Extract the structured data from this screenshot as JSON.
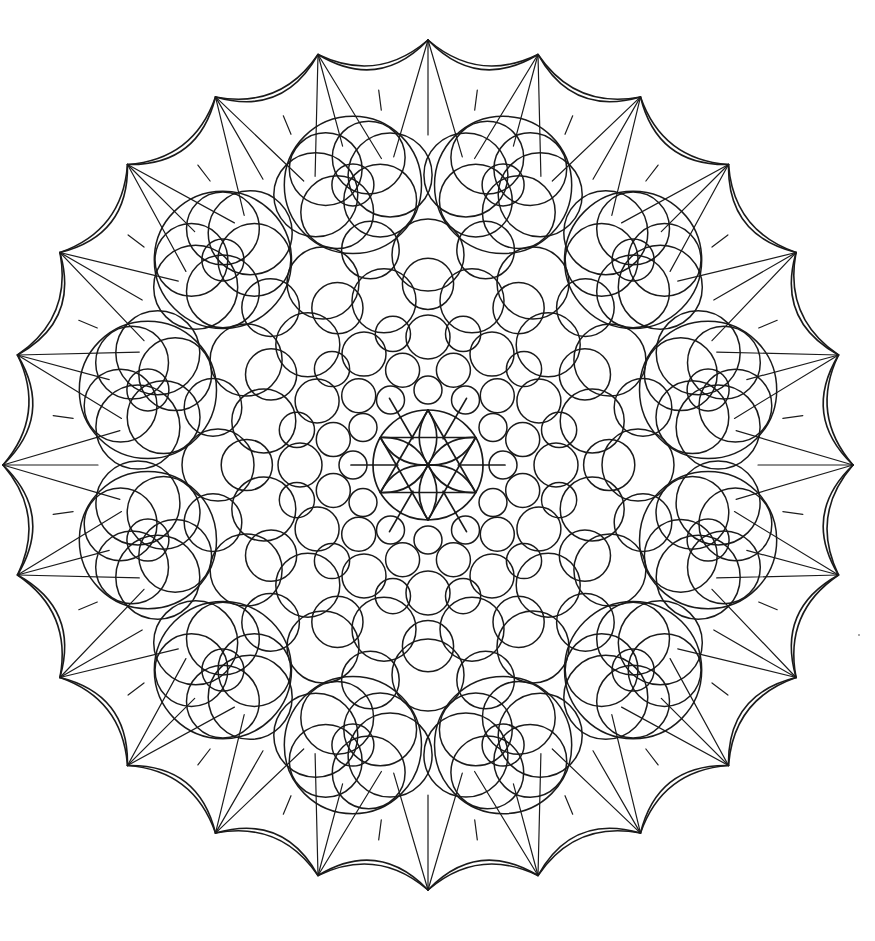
{
  "artwork": {
    "type": "mandala-coloring-page",
    "style": "black line art on white background",
    "background_color": "#ffffff",
    "line_color": "#1a1a1a",
    "center": [
      428,
      465
    ],
    "symmetry_fold": 12,
    "layers": [
      {
        "name": "center-star",
        "description": "six-petal flower inside circle with spokes",
        "radius": 55
      },
      {
        "name": "inner-bubble-ring-1",
        "count": 12,
        "radius": 75,
        "circle_r": 14
      },
      {
        "name": "inner-bubble-ring-2",
        "count": 12,
        "radius": 98,
        "circle_r": 17
      },
      {
        "name": "inner-bubble-ring-3",
        "count": 12,
        "radius": 128,
        "circle_r": 22
      },
      {
        "name": "middle-bubble-ring",
        "count": 12,
        "radius": 170,
        "circle_r": 32
      },
      {
        "name": "outer-bubble-ring",
        "count": 12,
        "radius": 210,
        "circle_r": 36
      },
      {
        "name": "quatrefoil-clusters",
        "count": 12,
        "radius": 290,
        "size": 70
      },
      {
        "name": "web-spokes",
        "count": 24,
        "inner_radius": 370,
        "outer_radius": 425
      },
      {
        "name": "scalloped-edge",
        "points": 24,
        "radius": 425
      }
    ]
  }
}
